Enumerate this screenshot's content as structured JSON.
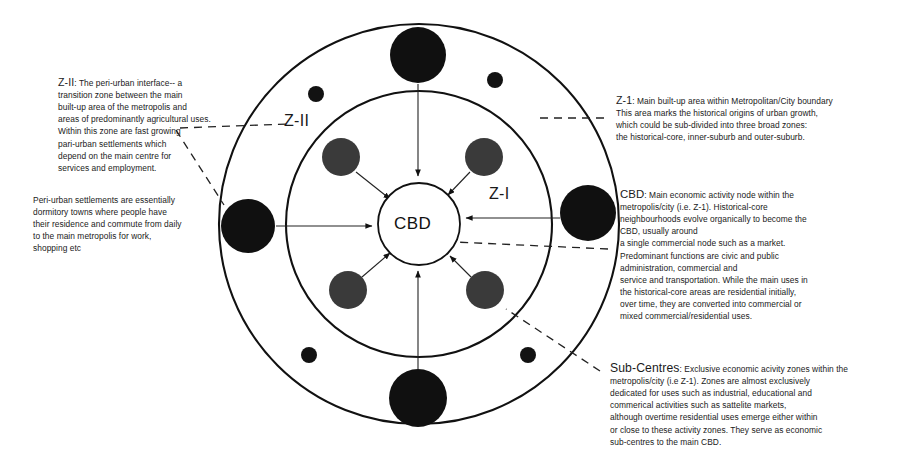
{
  "diagram": {
    "title_labels": {
      "outer_zone": "Z-II",
      "inner_zone": "Z-I",
      "core": "CBD"
    },
    "colors": {
      "stroke": "#111111",
      "outer_node_fill": "#101010",
      "inner_node_fill": "#3a3a3a",
      "core_fill": "#ffffff",
      "background": "#ffffff",
      "text": "#1a1a1a"
    },
    "geometry": {
      "center_x": 419,
      "center_y": 224,
      "outer_radius": 200,
      "middle_radius": 133,
      "core_radius": 41
    },
    "nodes": {
      "outer_large": [
        {
          "name": "node-outer-top",
          "cx": 418,
          "cy": 55,
          "r": 28
        },
        {
          "name": "node-outer-left",
          "cx": 248,
          "cy": 226,
          "r": 27
        },
        {
          "name": "node-outer-right",
          "cx": 588,
          "cy": 213,
          "r": 28
        },
        {
          "name": "node-outer-bottom",
          "cx": 418,
          "cy": 398,
          "r": 29
        }
      ],
      "outer_small": [
        {
          "name": "node-small-upper-left",
          "cx": 316,
          "cy": 94,
          "r": 8
        },
        {
          "name": "node-small-upper-right",
          "cx": 495,
          "cy": 80,
          "r": 8
        },
        {
          "name": "node-small-lower-left",
          "cx": 309,
          "cy": 355,
          "r": 8
        },
        {
          "name": "node-small-lower-right",
          "cx": 528,
          "cy": 355,
          "r": 8
        }
      ],
      "inner": [
        {
          "name": "node-inner-upper-left",
          "cx": 341,
          "cy": 157,
          "r": 19
        },
        {
          "name": "node-inner-upper-right",
          "cx": 484,
          "cy": 157,
          "r": 19
        },
        {
          "name": "node-inner-lower-left",
          "cx": 348,
          "cy": 290,
          "r": 19
        },
        {
          "name": "node-inner-lower-right",
          "cx": 485,
          "cy": 290,
          "r": 19
        }
      ]
    }
  },
  "annotations": {
    "z2": {
      "lead": "Z-II",
      "body": ": The peri-urban interface-- a\ntransition zone between the main\nbuilt-up area of the metropolis and\nareas of predominantly agricultural uses.\nWithin this zone are fast growing\npari-urban settlements which\ndepend on the main centre for\nservices and employment."
    },
    "peri_urban": {
      "body": "Peri-urban settlements are essentially\ndormitory towns where people have\ntheir residence  and commute from daily\nto the main metropolis for work,\nshopping etc"
    },
    "z1": {
      "lead": "Z-1",
      "body": ": Main built-up area within Metropolitan/City boundary\nThis area marks the historical origins of urban growth,\nwhich could be sub-divided into three broad zones:\nthe historical-core, inner-suburb and outer-suburb."
    },
    "cbd": {
      "lead": "CBD",
      "body": ": Main economic activity node within the\nmetropolis/city (i.e. Z-1). Historical-core\nneighbourhoods evolve organically to become the\nCBD, usually around\na single commercial node such as a market.\nPredominant functions are civic and public\nadministration, commercial and\nservice and transportation.  While the main uses in\nthe historical-core areas are residential initially,\nover time, they are converted into commercial or\nmixed commercial/residential uses."
    },
    "sub_centres": {
      "lead": "Sub-Centres",
      "body": ": Exclusive economic acivity zones within the\nmetropolis/city (i.e Z-1). Zones are almost exclusively\ndedicated for uses such as industrial, educational and\ncommerical activities such as sattelite markets,\nalthough overtime residential uses emerge either within\nor close to these activity zones. They serve as economic\nsub-centres to the main CBD."
    }
  }
}
